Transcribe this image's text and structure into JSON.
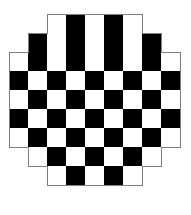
{
  "figure": {
    "name": "octagonal-checkerboard",
    "background_color": "#ffffff"
  },
  "board": {
    "grid_columns": 9,
    "grid_rows": 9,
    "cell_size": 19,
    "origin_x": 9,
    "origin_y": 14,
    "dark_color": "#000000",
    "light_color": "#ffffff",
    "outline_color": "#808080",
    "outline_width": 1,
    "top_left_is_light": true,
    "row_spans": [
      {
        "row": 0,
        "start_col": 2,
        "cell_count": 5
      },
      {
        "row": 1,
        "start_col": 1,
        "cell_count": 7
      },
      {
        "row": 2,
        "start_col": 0,
        "cell_count": 9
      },
      {
        "row": 3,
        "start_col": 0,
        "cell_count": 9
      },
      {
        "row": 4,
        "start_col": 0,
        "cell_count": 9
      },
      {
        "row": 5,
        "start_col": 0,
        "cell_count": 9
      },
      {
        "row": 6,
        "start_col": 0,
        "cell_count": 9
      },
      {
        "row": 7,
        "start_col": 1,
        "cell_count": 7
      },
      {
        "row": 8,
        "start_col": 2,
        "cell_count": 5
      }
    ],
    "cell_colors": [
      [
        "",
        "",
        "light",
        "dark",
        "light",
        "dark",
        "light",
        "",
        ""
      ],
      [
        "",
        "dark",
        "light",
        "dark",
        "light",
        "dark",
        "light",
        "dark",
        ""
      ],
      [
        "light",
        "dark",
        "light",
        "dark",
        "light",
        "dark",
        "light",
        "dark",
        "light"
      ],
      [
        "dark",
        "light",
        "dark",
        "light",
        "dark",
        "light",
        "dark",
        "light",
        "dark"
      ],
      [
        "light",
        "dark",
        "light",
        "dark",
        "light",
        "dark",
        "light",
        "dark",
        "light"
      ],
      [
        "dark",
        "light",
        "dark",
        "light",
        "dark",
        "light",
        "dark",
        "light",
        "dark"
      ],
      [
        "light",
        "dark",
        "light",
        "dark",
        "light",
        "dark",
        "light",
        "dark",
        "light"
      ],
      [
        "",
        "light",
        "dark",
        "light",
        "dark",
        "light",
        "dark",
        "light",
        ""
      ],
      [
        "",
        "",
        "light",
        "dark",
        "light",
        "dark",
        "light",
        "",
        ""
      ]
    ],
    "counts": {
      "total_cells": 69,
      "dark_cells": 34,
      "light_cells": 35
    }
  }
}
